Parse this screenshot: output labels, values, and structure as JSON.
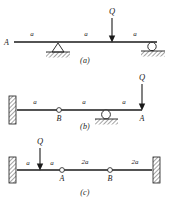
{
  "figure": {
    "title_caption_style": "italic-parenthetical",
    "line_color": "#1a1a1a",
    "background": "#ffffff",
    "panels": [
      {
        "id": "a",
        "caption": "(a)",
        "point_label_left": "A",
        "load_label": "Q",
        "dimensions": [
          "a",
          "a",
          "a"
        ],
        "supports": [
          "pin",
          "roller"
        ]
      },
      {
        "id": "b",
        "caption": "(b)",
        "hinge_label": "B",
        "end_label": "A",
        "load_label": "Q",
        "dimensions": [
          "a",
          "a",
          "a"
        ],
        "supports": [
          "fixed-wall",
          "roller"
        ]
      },
      {
        "id": "c",
        "caption": "(c)",
        "load_label": "Q",
        "hinge_label_1": "A",
        "hinge_label_2": "B",
        "dimensions": [
          "a",
          "a",
          "2a",
          "2a"
        ],
        "supports": [
          "fixed-wall",
          "fixed-wall"
        ]
      }
    ]
  }
}
